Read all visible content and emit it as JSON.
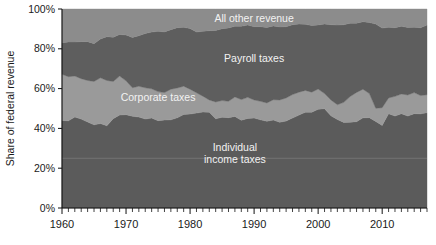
{
  "chart_data": {
    "type": "area",
    "title": "",
    "subtitle": "",
    "xlabel": "",
    "ylabel": "Share of  federal revenue",
    "stacked": true,
    "stack_order_bottom_to_top": [
      "Individual income taxes",
      "Corporate taxes",
      "Payroll taxes",
      "All other revenue"
    ],
    "xlim": [
      1960,
      2017
    ],
    "ylim": [
      0,
      100
    ],
    "y_unit": "percent",
    "grid": "single faint horizontal line at 25%",
    "gridlines": [
      25
    ],
    "legend": "inline band labels",
    "x_ticks_major": [
      1960,
      1970,
      1980,
      1990,
      2000,
      2010
    ],
    "x_tick_labels": [
      "1960",
      "1970",
      "1980",
      "1990",
      "2000",
      "2010"
    ],
    "x_minor_tick_interval": 1,
    "y_ticks": [
      0,
      20,
      40,
      60,
      80,
      100
    ],
    "y_tick_labels": [
      "0%",
      "20%",
      "40%",
      "60%",
      "80%",
      "100%"
    ],
    "annotations": [
      {
        "text": "All other revenue",
        "series": "All other revenue",
        "x": 1990,
        "y": 95
      },
      {
        "text": "Payroll taxes",
        "series": "Payroll taxes",
        "x": 1990,
        "y": 75
      },
      {
        "text": "Corporate taxes",
        "series": "Corporate taxes",
        "x": 1975,
        "y": 55
      },
      {
        "text": "Individual",
        "series": "Individual income taxes",
        "x": 1987,
        "y": 30
      },
      {
        "text": "income taxes",
        "series": "Individual income taxes",
        "x": 1987,
        "y": 24
      }
    ],
    "colors": {
      "individual_income_taxes": "#5b5b5b",
      "corporate_taxes": "#9a9a9a",
      "payroll_taxes": "#5e5e5e",
      "all_other_revenue": "#8c8c8c",
      "axis": "#111111",
      "label_light": "#f2f2f2",
      "gridline": "#8d8d8d",
      "background": "#ffffff"
    },
    "x": [
      1960,
      1961,
      1962,
      1963,
      1964,
      1965,
      1966,
      1967,
      1968,
      1969,
      1970,
      1971,
      1972,
      1973,
      1974,
      1975,
      1976,
      1977,
      1978,
      1979,
      1980,
      1981,
      1982,
      1983,
      1984,
      1985,
      1986,
      1987,
      1988,
      1989,
      1990,
      1991,
      1992,
      1993,
      1994,
      1995,
      1996,
      1997,
      1998,
      1999,
      2000,
      2001,
      2002,
      2003,
      2004,
      2005,
      2006,
      2007,
      2008,
      2009,
      2010,
      2011,
      2012,
      2013,
      2014,
      2015,
      2016,
      2017
    ],
    "series": [
      {
        "name": "Individual income taxes",
        "color": "#5b5b5b",
        "values": [
          44.0,
          43.8,
          45.7,
          44.7,
          43.2,
          41.8,
          42.4,
          41.3,
          44.9,
          46.7,
          46.9,
          46.1,
          45.7,
          44.7,
          45.2,
          43.9,
          44.2,
          44.3,
          45.3,
          47.0,
          47.2,
          47.7,
          48.2,
          48.1,
          44.8,
          45.6,
          45.4,
          46.0,
          44.1,
          45.0,
          45.2,
          44.3,
          43.6,
          44.2,
          43.1,
          43.7,
          45.2,
          46.7,
          48.1,
          48.1,
          49.6,
          49.9,
          46.3,
          44.5,
          43.0,
          43.1,
          43.4,
          45.3,
          45.4,
          43.5,
          41.5,
          47.4,
          46.2,
          47.4,
          46.2,
          47.4,
          47.3,
          47.9
        ]
      },
      {
        "name": "Corporate taxes",
        "color": "#9a9a9a",
        "values": [
          23.2,
          22.2,
          20.6,
          20.3,
          20.9,
          21.8,
          23.0,
          22.8,
          18.7,
          19.6,
          17.0,
          14.3,
          15.5,
          15.7,
          14.7,
          14.6,
          13.8,
          15.4,
          15.0,
          14.2,
          12.5,
          10.2,
          8.0,
          6.2,
          8.5,
          8.4,
          8.2,
          9.8,
          10.4,
          10.6,
          9.1,
          9.3,
          9.2,
          10.2,
          11.2,
          11.6,
          11.8,
          11.5,
          11.0,
          10.1,
          10.2,
          7.6,
          8.0,
          7.4,
          10.1,
          12.9,
          14.7,
          14.4,
          12.1,
          6.6,
          8.9,
          7.9,
          9.9,
          9.9,
          10.6,
          10.6,
          9.2,
          9.0
        ]
      },
      {
        "name": "Payroll taxes",
        "color": "#5e5e5e",
        "values": [
          15.9,
          17.4,
          17.1,
          18.6,
          19.5,
          19.0,
          19.5,
          22.0,
          22.2,
          20.9,
          23.0,
          25.3,
          25.4,
          27.3,
          28.5,
          30.3,
          30.5,
          29.9,
          30.3,
          29.6,
          30.5,
          30.5,
          32.6,
          34.8,
          35.9,
          36.1,
          36.9,
          35.5,
          36.8,
          36.3,
          36.8,
          37.5,
          37.9,
          37.1,
          36.7,
          35.8,
          35.1,
          34.2,
          33.2,
          33.5,
          32.2,
          34.9,
          37.8,
          40.0,
          39.0,
          36.9,
          34.8,
          33.9,
          35.7,
          42.3,
          40.0,
          35.5,
          34.5,
          34.0,
          33.9,
          32.8,
          34.1,
          35.0
        ]
      },
      {
        "name": "All other revenue",
        "color": "#8c8c8c",
        "values": [
          16.9,
          16.6,
          16.6,
          16.4,
          16.4,
          17.4,
          15.1,
          13.9,
          14.2,
          12.8,
          13.1,
          14.3,
          13.4,
          12.3,
          11.6,
          11.2,
          11.5,
          10.4,
          9.4,
          9.2,
          9.8,
          11.6,
          11.2,
          10.9,
          10.8,
          9.9,
          9.5,
          8.7,
          8.7,
          8.1,
          8.9,
          8.9,
          9.3,
          8.5,
          9.0,
          8.9,
          7.9,
          7.6,
          7.7,
          8.3,
          8.0,
          7.6,
          7.9,
          8.1,
          7.9,
          7.1,
          7.1,
          6.4,
          6.8,
          7.6,
          9.6,
          9.2,
          9.4,
          8.7,
          9.3,
          9.2,
          9.4,
          8.1
        ]
      }
    ]
  }
}
